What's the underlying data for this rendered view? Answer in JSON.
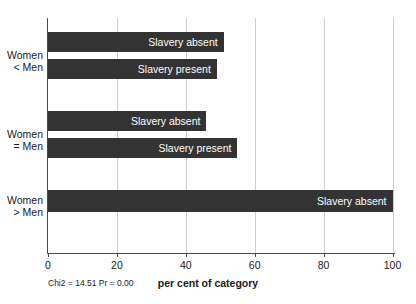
{
  "chart_data": {
    "type": "bar",
    "orientation": "horizontal",
    "title": "",
    "xlabel": "per cent of category",
    "ylabel": "",
    "xlim": [
      0,
      100
    ],
    "xticks": [
      0,
      20,
      40,
      60,
      80,
      100
    ],
    "xtick_labels": [
      "0",
      "20",
      "40",
      "60",
      "80",
      "100"
    ],
    "grid": true,
    "grid_axis": "x",
    "legend": false,
    "bar_color": "#333333",
    "bar_label_color": "#ffffff",
    "grid_color": "#cfcfcf",
    "axis_color": "#4a4a4a",
    "categories": [
      "Women\n< Men",
      "Women\n= Men",
      "Women\n> Men"
    ],
    "bars": [
      {
        "group": "Women < Men",
        "label": "Slavery absent",
        "value": 51
      },
      {
        "group": "Women < Men",
        "label": "Slavery present",
        "value": 49
      },
      {
        "group": "Women = Men",
        "label": "Slavery absent",
        "value": 46
      },
      {
        "group": "Women = Men",
        "label": "Slavery present",
        "value": 55
      },
      {
        "group": "Women > Men",
        "label": "Slavery absent",
        "value": 100
      }
    ],
    "annotation": "Chi2 = 14.51  Pr = 0.00"
  }
}
